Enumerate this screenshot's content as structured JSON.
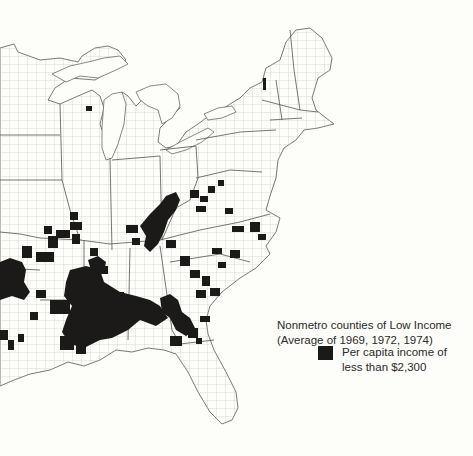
{
  "map": {
    "region": "Eastern United States (county boundaries)",
    "colors": {
      "background": "#fdfdf9",
      "land": "#fdfdf9",
      "county_lines": "#b8b8b0",
      "state_lines": "#5a5a55",
      "low_income_fill": "#1c1a18"
    }
  },
  "legend": {
    "title_line1": "Nonmetro counties of Low Income",
    "title_line2": "(Average of 1969, 1972, 1974)",
    "items": [
      {
        "label_line1": "Per capita income of",
        "label_line2": "less than $2,300",
        "color": "#1c1a18"
      }
    ]
  }
}
